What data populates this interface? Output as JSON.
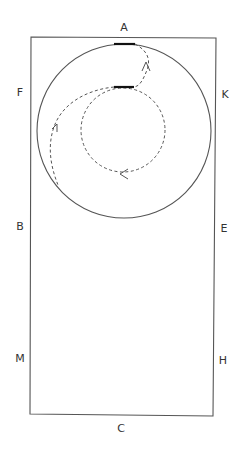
{
  "diagram": {
    "type": "dressage-arena-figure",
    "arena": {
      "shape": "rectangle",
      "stroke_color": "#555555"
    },
    "letters": [
      {
        "label": "A",
        "x": 124,
        "y": 27
      },
      {
        "label": "F",
        "x": 20,
        "y": 92
      },
      {
        "label": "K",
        "x": 225,
        "y": 94
      },
      {
        "label": "B",
        "x": 20,
        "y": 226
      },
      {
        "label": "E",
        "x": 224,
        "y": 228
      },
      {
        "label": "M",
        "x": 20,
        "y": 358
      },
      {
        "label": "H",
        "x": 223,
        "y": 360
      },
      {
        "label": "C",
        "x": 121,
        "y": 428
      }
    ],
    "figures": {
      "outer_circle": {
        "style": "solid",
        "color": "#555555"
      },
      "inner_circle": {
        "style": "dashed",
        "color": "#555555"
      },
      "path": {
        "style": "dashed",
        "color": "#555555"
      },
      "markers": {
        "style": "thick-segment",
        "color": "#111111"
      },
      "arrows": [
        {
          "direction": "up",
          "location": "between top markers"
        },
        {
          "direction": "up",
          "location": "left side of large circle"
        },
        {
          "direction": "left",
          "location": "bottom of inner circle"
        }
      ]
    }
  }
}
